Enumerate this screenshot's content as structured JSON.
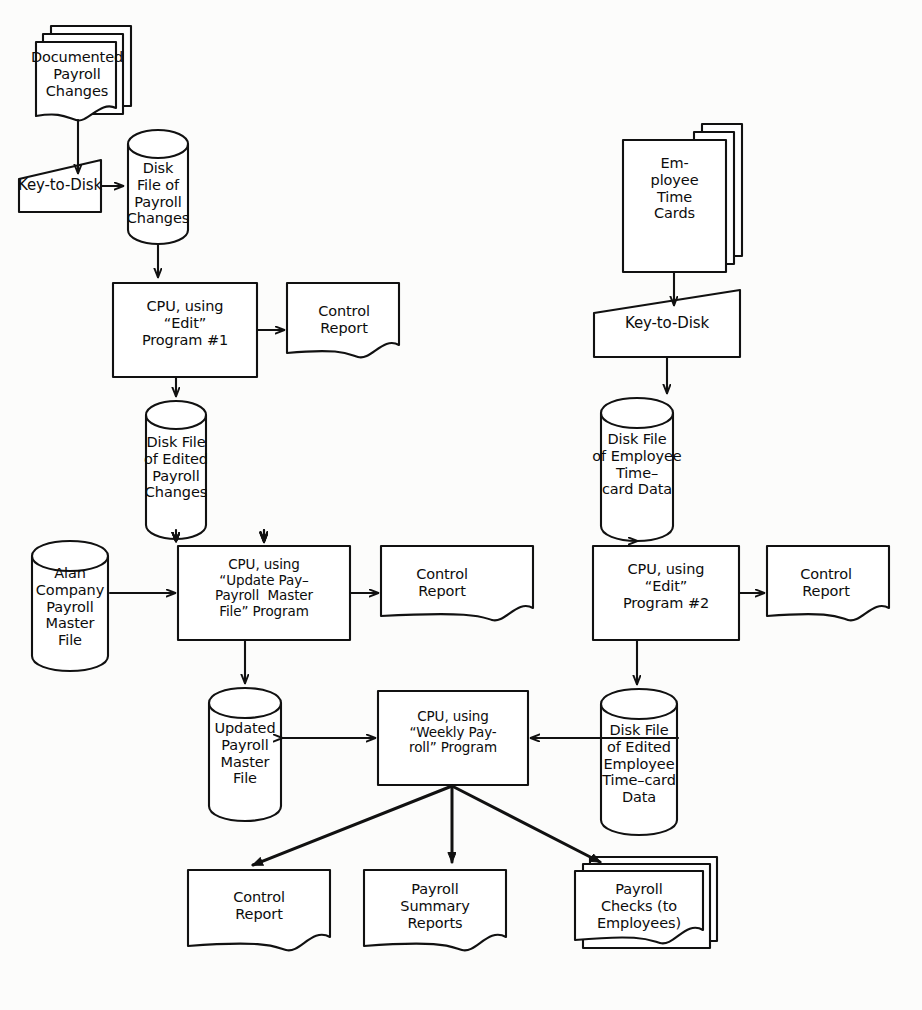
{
  "diagram": {
    "type": "system-flowchart",
    "stroke_color": "#111111",
    "fill_color": "#ffffff",
    "background_color": "#fcfcfb"
  },
  "nodes": {
    "documented_payroll_changes": {
      "shape": "document-stack",
      "label": "Documented\nPayroll\nChanges"
    },
    "key_to_disk_1": {
      "shape": "manual-input",
      "label": "Key-to-Disk"
    },
    "disk_file_payroll_changes": {
      "shape": "magnetic-disk",
      "label": "Disk\nFile of\nPayroll\nChanges"
    },
    "cpu_edit_program_1": {
      "shape": "process",
      "label": "CPU, using\n“Edit”\nProgram #1"
    },
    "control_report_1": {
      "shape": "document",
      "label": "Control\nReport"
    },
    "disk_file_edited_payroll_changes": {
      "shape": "magnetic-disk",
      "label": "Disk File\nof Edited\nPayroll\nChanges"
    },
    "employee_time_cards": {
      "shape": "document-stack",
      "label": "Em-\nployee\nTime\nCards"
    },
    "key_to_disk_2": {
      "shape": "manual-input",
      "label": "Key-to-Disk"
    },
    "disk_file_employee_timecard_data": {
      "shape": "magnetic-disk",
      "label": "Disk File\nof Employee\nTime–\ncard Data"
    },
    "cpu_edit_program_2": {
      "shape": "process",
      "label": "CPU, using\n“Edit”\nProgram #2"
    },
    "control_report_2": {
      "shape": "document",
      "label": "Control\nReport"
    },
    "alan_company_payroll_master_file": {
      "shape": "magnetic-disk",
      "label": "Alan\nCompany\nPayroll\nMaster\nFile"
    },
    "cpu_update_pay_payroll_master_file": {
      "shape": "process",
      "label": "CPU, using\n“Update Pay–\nPayroll  Master\nFile” Program"
    },
    "control_report_3": {
      "shape": "document",
      "label": "Control\nReport"
    },
    "updated_payroll_master_file": {
      "shape": "magnetic-disk",
      "label": "Updated\nPayroll\nMaster\nFile"
    },
    "disk_file_edited_employee_timecard_data": {
      "shape": "magnetic-disk",
      "label": "Disk File\nof Edited\nEmployee\nTime–card\nData"
    },
    "cpu_weekly_payroll_program": {
      "shape": "process",
      "label": "CPU, using\n“Weekly Pay-\nroll” Program"
    },
    "control_report_4": {
      "shape": "document",
      "label": "Control\nReport"
    },
    "payroll_summary_reports": {
      "shape": "document",
      "label": "Payroll\nSummary\nReports"
    },
    "payroll_checks": {
      "shape": "document-stack",
      "label": "Payroll\nChecks (to\nEmployees)"
    }
  },
  "edges": [
    {
      "from": "documented_payroll_changes",
      "to": "key_to_disk_1",
      "style": "arrow"
    },
    {
      "from": "key_to_disk_1",
      "to": "disk_file_payroll_changes",
      "style": "arrow"
    },
    {
      "from": "disk_file_payroll_changes",
      "to": "cpu_edit_program_1",
      "style": "arrow"
    },
    {
      "from": "cpu_edit_program_1",
      "to": "control_report_1",
      "style": "arrow"
    },
    {
      "from": "cpu_edit_program_1",
      "to": "disk_file_edited_payroll_changes",
      "style": "arrow"
    },
    {
      "from": "disk_file_edited_payroll_changes",
      "to": "cpu_update_pay_payroll_master_file",
      "style": "arrow"
    },
    {
      "from": "employee_time_cards",
      "to": "key_to_disk_2",
      "style": "arrow"
    },
    {
      "from": "key_to_disk_2",
      "to": "disk_file_employee_timecard_data",
      "style": "arrow"
    },
    {
      "from": "disk_file_employee_timecard_data",
      "to": "cpu_edit_program_2",
      "style": "arrow"
    },
    {
      "from": "cpu_edit_program_2",
      "to": "control_report_2",
      "style": "arrow"
    },
    {
      "from": "cpu_edit_program_2",
      "to": "disk_file_edited_employee_timecard_data",
      "style": "arrow"
    },
    {
      "from": "alan_company_payroll_master_file",
      "to": "cpu_update_pay_payroll_master_file",
      "style": "arrow"
    },
    {
      "from": "cpu_update_pay_payroll_master_file",
      "to": "control_report_3",
      "style": "arrow"
    },
    {
      "from": "cpu_update_pay_payroll_master_file",
      "to": "updated_payroll_master_file",
      "style": "arrow"
    },
    {
      "from": "updated_payroll_master_file",
      "to": "cpu_weekly_payroll_program",
      "style": "double-arrow"
    },
    {
      "from": "disk_file_edited_employee_timecard_data",
      "to": "cpu_weekly_payroll_program",
      "style": "arrow"
    },
    {
      "from": "cpu_weekly_payroll_program",
      "to": "control_report_4",
      "style": "arrow"
    },
    {
      "from": "cpu_weekly_payroll_program",
      "to": "payroll_summary_reports",
      "style": "arrow"
    },
    {
      "from": "cpu_weekly_payroll_program",
      "to": "payroll_checks",
      "style": "arrow"
    }
  ]
}
